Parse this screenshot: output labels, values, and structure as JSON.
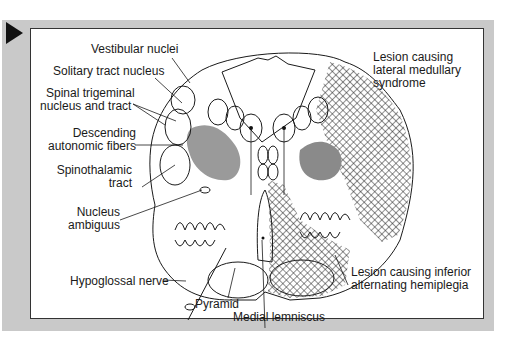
{
  "figure": {
    "colors": {
      "panel_bg": "#c9c9c9",
      "box_bg": "#ffffff",
      "outline": "#1a1a1a",
      "shaded_nucleus": "#9a9a9a",
      "hatch": "#222222"
    }
  },
  "labels": {
    "vestibular_nuclei": "Vestibular nuclei",
    "solitary_tract_nucleus": "Solitary tract nucleus",
    "spinal_trigeminal_1": "Spinal trigeminal",
    "spinal_trigeminal_2": "nucleus and tract",
    "descending_autonomic_1": "Descending",
    "descending_autonomic_2": "autonomic fibers",
    "spinothalamic_1": "Spinothalamic",
    "spinothalamic_2": "tract",
    "nucleus_ambiguus_1": "Nucleus",
    "nucleus_ambiguus_2": "ambiguus",
    "hypoglossal_nerve": "Hypoglossal nerve",
    "pyramid": "Pyramid",
    "medial_lemniscus": "Medial lemniscus",
    "lateral_lesion_1": "Lesion causing",
    "lateral_lesion_2": "lateral medullary",
    "lateral_lesion_3": "syndrome",
    "inferior_lesion_1": "Lesion causing inferior",
    "inferior_lesion_2": "alternating hemiplegia"
  }
}
